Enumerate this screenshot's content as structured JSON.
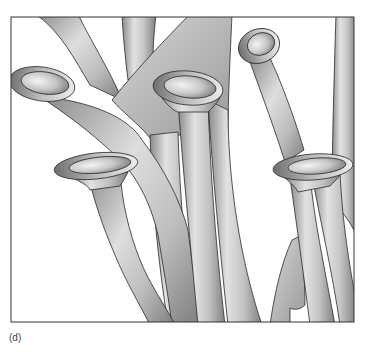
{
  "figure": {
    "panel_label": "(d)",
    "frame": {
      "x": 11,
      "y": 17,
      "width": 343,
      "height": 305,
      "stroke": "#333333"
    },
    "colors": {
      "background": "#ffffff",
      "tube_light": "#e6e6e6",
      "tube_mid": "#b4b4b4",
      "tube_dark": "#7a7a7a",
      "outline": "#2a2a2a",
      "opening_inner_light": "#f2f2f2",
      "opening_inner_dark": "#8a8a8a"
    },
    "openings": [
      {
        "name": "left-opening",
        "cx": 42,
        "cy": 84,
        "rx": 32,
        "ry": 16
      },
      {
        "name": "center-opening",
        "cx": 188,
        "cy": 87,
        "rx": 34,
        "ry": 17
      },
      {
        "name": "upper-right-opening",
        "cx": 259,
        "cy": 46,
        "rx": 20,
        "ry": 16
      },
      {
        "name": "lower-left-opening",
        "cx": 96,
        "cy": 166,
        "rx": 40,
        "ry": 13
      },
      {
        "name": "lower-right-opening",
        "cx": 313,
        "cy": 167,
        "rx": 38,
        "ry": 13
      }
    ]
  }
}
